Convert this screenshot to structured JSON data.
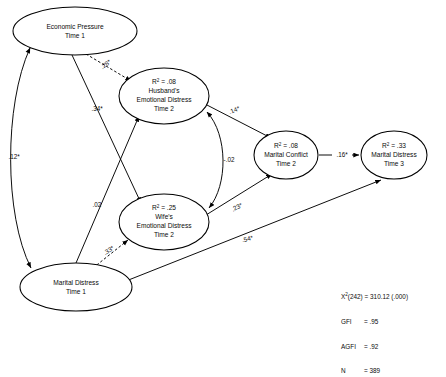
{
  "figure": {
    "type": "path-diagram"
  },
  "nodes": [
    {
      "id": "economic_pressure_t1",
      "r2": "",
      "lines": [
        "Economic Pressure",
        "Time 1"
      ],
      "cx": 75,
      "cy": 31,
      "rx": 62,
      "ry": 24
    },
    {
      "id": "husband_distress_t2",
      "r2": ".08",
      "lines": [
        "Husband's",
        "Emotional Distress",
        "Time 2"
      ],
      "cx": 164,
      "cy": 96,
      "rx": 45,
      "ry": 28
    },
    {
      "id": "wife_distress_t2",
      "r2": ".25",
      "lines": [
        "Wife's",
        "Emotional Distress",
        "Time 2"
      ],
      "cx": 164,
      "cy": 222,
      "rx": 45,
      "ry": 28
    },
    {
      "id": "marital_conflict_t2",
      "r2": ".08",
      "lines": [
        "Marital Conflict",
        "Time 2"
      ],
      "cx": 286,
      "cy": 155,
      "rx": 32,
      "ry": 24
    },
    {
      "id": "marital_distress_t3",
      "r2": ".33",
      "lines": [
        "Marital Distress",
        "Time 3"
      ],
      "cx": 394,
      "cy": 155,
      "rx": 33,
      "ry": 24
    },
    {
      "id": "marital_distress_t1",
      "r2": "",
      "lines": [
        "Marital Distress",
        "Time 1"
      ],
      "cx": 76,
      "cy": 287,
      "rx": 56,
      "ry": 24
    }
  ],
  "r2_prefix": "R",
  "r2_exp": "2",
  "r2_eq": " = ",
  "paths": [
    {
      "id": "ep_to_husband",
      "from": "economic_pressure_t1",
      "to": "husband_distress_t2",
      "label": ".28*",
      "style": "dashed",
      "lx": 107,
      "ly": 65,
      "rot": -38
    },
    {
      "id": "ep_to_wife",
      "from": "economic_pressure_t1",
      "to": "wife_distress_t2",
      "label": ".34*",
      "style": "solid",
      "lx": 97,
      "ly": 110,
      "rot": 0
    },
    {
      "id": "ep_corr_md1",
      "from": "economic_pressure_t1",
      "to": "marital_distress_t1",
      "label": ".12*",
      "style": "curve-double",
      "lx": 14,
      "ly": 157,
      "rot": 0
    },
    {
      "id": "md1_to_husband",
      "from": "marital_distress_t1",
      "to": "husband_distress_t2",
      "label": ".02",
      "style": "solid",
      "lx": 96,
      "ly": 206,
      "rot": 0
    },
    {
      "id": "husband_corr_wife",
      "from": "husband_distress_t2",
      "to": "wife_distress_t2",
      "label": "-.02",
      "style": "curve-double",
      "lx": 228,
      "ly": 160,
      "rot": 0
    },
    {
      "id": "husband_to_conflict",
      "from": "husband_distress_t2",
      "to": "marital_conflict_t2",
      "label": ".14*",
      "style": "solid",
      "lx": 234,
      "ly": 110,
      "rot": -22
    },
    {
      "id": "md1_to_wife",
      "from": "marital_distress_t1",
      "to": "wife_distress_t2",
      "label": ".33*",
      "style": "dashed",
      "lx": 110,
      "ly": 250,
      "rot": -33
    },
    {
      "id": "wife_to_conflict",
      "from": "wife_distress_t2",
      "to": "marital_conflict_t2",
      "label": ".23*",
      "style": "solid",
      "lx": 237,
      "ly": 207,
      "rot": -27
    },
    {
      "id": "conflict_to_md3",
      "from": "marital_conflict_t2",
      "to": "marital_distress_t3",
      "label": ".16*",
      "style": "solid",
      "lx": 343,
      "ly": 155,
      "rot": 0
    },
    {
      "id": "md1_to_md3",
      "from": "marital_distress_t1",
      "to": "marital_distress_t3",
      "label": ".54*",
      "style": "solid",
      "lx": 247,
      "ly": 239,
      "rot": -13
    }
  ],
  "fit_stats": {
    "chisq_label": "X",
    "chisq_exp": "2",
    "chisq_df": "(242)",
    "chisq_eq": " = 310.12 (.000)",
    "rows": [
      {
        "label": "GFI",
        "eq": "= .95"
      },
      {
        "label": "AGFI",
        "eq": "= .92"
      },
      {
        "label": "N",
        "eq": "= 389"
      }
    ]
  },
  "colors": {
    "ink": "#000000",
    "paper": "#ffffff"
  }
}
